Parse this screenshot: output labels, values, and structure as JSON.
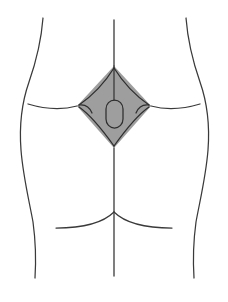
{
  "figure": {
    "background_color": "#ffffff",
    "outline_color": "#3a3a3a",
    "rhomboid_fill_color": "#9e9e9e",
    "inner_line_color": "#2e2e2e",
    "caption": "",
    "width": 228,
    "height": 302
  },
  "labels": {
    "left_contour": "left flank contour",
    "right_contour": "right flank contour",
    "vertical_midline": "vertebral midline",
    "left_lateral_line": "left iliac crest line",
    "right_lateral_line": "right iliac crest line",
    "rhomboid": "Michaelis rhomboid",
    "sacrum": "sacral oval",
    "left_gluteal_fold": "left gluteal fold",
    "right_gluteal_fold": "right gluteal fold",
    "natal_cleft": "natal cleft"
  },
  "geometry": {
    "rhomboid_vertices": {
      "top": [
        114,
        66
      ],
      "right": [
        151,
        106
      ],
      "bottom": [
        114,
        148
      ],
      "left": [
        77,
        106
      ]
    },
    "sacrum_oval": {
      "x": 106,
      "y": 100,
      "width": 17,
      "height": 28
    },
    "midline_top_y": 20,
    "midline_bottom_y": 276,
    "gluteal_fold_y": 212
  }
}
